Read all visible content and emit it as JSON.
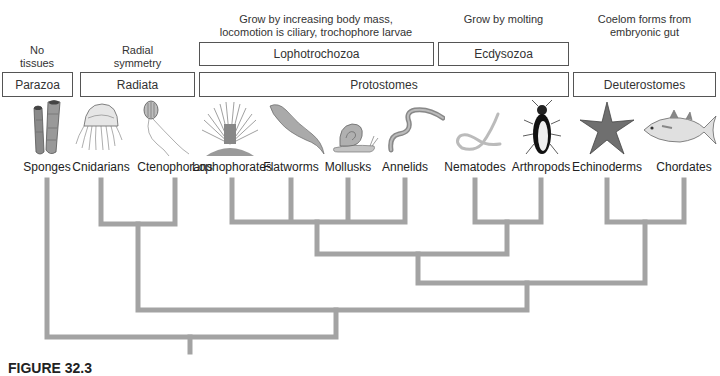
{
  "traits": {
    "parazoa": "No\ntissues",
    "radiata": "Radial\nsymmetry",
    "lophotrochozoa": "Grow by increasing body mass,\nlocomotion is ciliary, trochophore larvae",
    "ecdysozoa": "Grow by molting",
    "deuterostomes": "Coelom forms from\nembryonic gut"
  },
  "boxes_top": {
    "lophotrochozoa": "Lophotrochozoa",
    "ecdysozoa": "Ecdysozoa"
  },
  "boxes_bottom": {
    "parazoa": "Parazoa",
    "radiata": "Radiata",
    "protostomes": "Protostomes",
    "deuterostomes": "Deuterostomes"
  },
  "taxa": [
    {
      "name": "Sponges",
      "icon": "sponge-icon"
    },
    {
      "name": "Cnidarians",
      "icon": "jellyfish-icon"
    },
    {
      "name": "Ctenophorans",
      "icon": "comb-jelly-icon"
    },
    {
      "name": "Lophophorates",
      "icon": "lophophorate-icon"
    },
    {
      "name": "Flatworms",
      "icon": "flatworm-icon"
    },
    {
      "name": "Mollusks",
      "icon": "snail-icon"
    },
    {
      "name": "Annelids",
      "icon": "earthworm-icon"
    },
    {
      "name": "Nematodes",
      "icon": "roundworm-icon"
    },
    {
      "name": "Arthropods",
      "icon": "beetle-icon"
    },
    {
      "name": "Echinoderms",
      "icon": "starfish-icon"
    },
    {
      "name": "Chordates",
      "icon": "fish-icon"
    }
  ],
  "caption": "FIGURE 32.3",
  "colors": {
    "tree_line": "#a3a3a3",
    "box_border": "#555555",
    "organism_gray": "#8a8a8a"
  }
}
